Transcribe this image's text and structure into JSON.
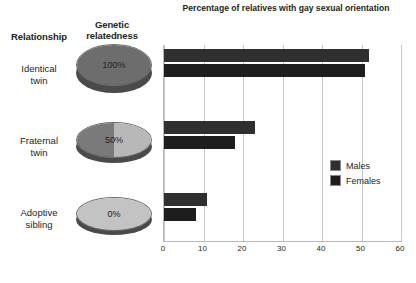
{
  "headers": {
    "relationship": "Relationship",
    "relatedness_line1": "Genetic",
    "relatedness_line2": "relatedness"
  },
  "rows": [
    {
      "label_line1": "Identical",
      "label_line2": "twin",
      "relatedness_label": "100%",
      "disc_fill_left": "#6d6d6d",
      "disc_fill_right": "#6d6d6d"
    },
    {
      "label_line1": "Fraternal",
      "label_line2": "twin",
      "relatedness_label": "50%",
      "disc_fill_left": "#7a7a7a",
      "disc_fill_right": "#b8b8b8"
    },
    {
      "label_line1": "Adoptive",
      "label_line2": "sibling",
      "relatedness_label": "0%",
      "disc_fill_left": "#c3c3c3",
      "disc_fill_right": "#c3c3c3"
    }
  ],
  "legend": {
    "males_label": "Males",
    "females_label": "Females",
    "males_color": "#2f2f2f",
    "females_color": "#1d1d1d"
  },
  "chart_data": {
    "type": "bar",
    "orientation": "horizontal",
    "title": "Percentage of relatives with gay sexual orientation",
    "xlabel": "",
    "ylabel": "",
    "categories": [
      "Identical twin",
      "Fraternal twin",
      "Adoptive sibling"
    ],
    "series": [
      {
        "name": "Males",
        "values": [
          52,
          23,
          11
        ],
        "color": "#2f2f2f"
      },
      {
        "name": "Females",
        "values": [
          51,
          18,
          8
        ],
        "color": "#1d1d1d"
      }
    ],
    "xlim": [
      0,
      60
    ],
    "xticks": [
      0,
      10,
      20,
      30,
      40,
      50,
      60
    ],
    "xtick_labels": [
      "0",
      "10",
      "20",
      "30",
      "40",
      "50",
      "60"
    ],
    "grid": true,
    "legend_position": "middle-right"
  }
}
